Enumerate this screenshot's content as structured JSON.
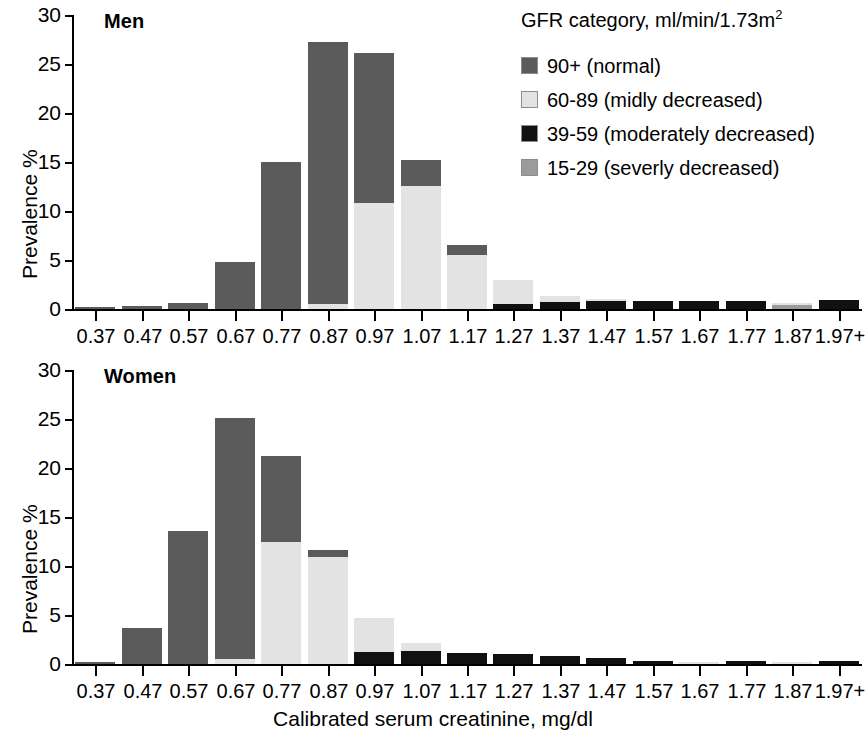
{
  "figure": {
    "xlabel": "Calibrated serum creatinine, mg/dl",
    "ylabel": "Prevalence %"
  },
  "legend": {
    "title_main": "GFR category, ml/min/1.73m",
    "title_sup": "2",
    "items": [
      {
        "label": "90+ (normal)",
        "color": "#5b5b5b"
      },
      {
        "label": "60-89 (midly decreased)",
        "color": "#e3e3e3"
      },
      {
        "label": "39-59 (moderately decreased)",
        "color": "#111111"
      },
      {
        "label": "15-29 (severly decreased)",
        "color": "#9b9b9b"
      }
    ]
  },
  "panels": [
    {
      "title": "Men"
    },
    {
      "title": "Women"
    }
  ],
  "chart_data": {
    "type": "bar",
    "subtype": "stacked histogram",
    "title": "",
    "xlabel": "Calibrated serum creatinine, mg/dl",
    "ylabel": "Prevalence %",
    "ylim": [
      0,
      30
    ],
    "yticks": [
      0,
      5,
      10,
      15,
      20,
      25,
      30
    ],
    "ytick_labels": [
      "0",
      "5",
      "10",
      "15",
      "20",
      "25",
      "30"
    ],
    "grid": false,
    "legend_position": "top-right",
    "legend_title": "GFR category, ml/min/1.73m2",
    "categories": [
      "0.37",
      "0.47",
      "0.57",
      "0.67",
      "0.77",
      "0.87",
      "0.97",
      "1.07",
      "1.17",
      "1.27",
      "1.37",
      "1.47",
      "1.57",
      "1.67",
      "1.77",
      "1.87",
      "1.97+"
    ],
    "panels": [
      {
        "name": "Men",
        "series": [
          {
            "name": "90+ (normal)",
            "color": "#5b5b5b",
            "values": [
              0.25,
              0.35,
              0.6,
              4.8,
              15.0,
              26.7,
              15.3,
              2.6,
              1.0,
              0.0,
              0.0,
              0.0,
              0.0,
              0.0,
              0.0,
              0.0,
              0.0
            ]
          },
          {
            "name": "60-89 (midly decreased)",
            "color": "#e3e3e3",
            "values": [
              0.0,
              0.0,
              0.0,
              0.0,
              0.0,
              0.55,
              10.8,
              12.6,
              5.5,
              2.4,
              0.6,
              0.15,
              0.0,
              0.0,
              0.0,
              0.25,
              0.0
            ]
          },
          {
            "name": "39-59 (moderately decreased)",
            "color": "#111111",
            "values": [
              0.0,
              0.0,
              0.0,
              0.0,
              0.0,
              0.0,
              0.0,
              0.0,
              0.0,
              0.55,
              0.75,
              0.8,
              0.85,
              0.85,
              0.8,
              0.0,
              0.9
            ]
          },
          {
            "name": "15-29 (severly decreased)",
            "color": "#9b9b9b",
            "values": [
              0.0,
              0.0,
              0.0,
              0.0,
              0.0,
              0.0,
              0.0,
              0.0,
              0.0,
              0.0,
              0.0,
              0.0,
              0.0,
              0.0,
              0.0,
              0.4,
              0.0
            ]
          }
        ],
        "totals": [
          0.25,
          0.35,
          0.6,
          4.8,
          15.0,
          27.25,
          26.1,
          15.2,
          6.5,
          2.95,
          1.35,
          0.95,
          0.85,
          0.85,
          0.8,
          0.65,
          0.9
        ]
      },
      {
        "name": "Women",
        "series": [
          {
            "name": "90+ (normal)",
            "color": "#5b5b5b",
            "values": [
              0.2,
              3.7,
              13.6,
              24.6,
              8.7,
              0.7,
              0.0,
              0.0,
              0.0,
              0.0,
              0.0,
              0.0,
              0.0,
              0.0,
              0.0,
              0.0,
              0.0
            ]
          },
          {
            "name": "60-89 (midly decreased)",
            "color": "#e3e3e3",
            "values": [
              0.0,
              0.0,
              0.0,
              0.55,
              12.5,
              10.9,
              3.5,
              0.8,
              0.0,
              0.0,
              0.0,
              0.0,
              0.0,
              0.25,
              0.0,
              0.2,
              0.0
            ]
          },
          {
            "name": "39-59 (moderately decreased)",
            "color": "#111111",
            "values": [
              0.0,
              0.0,
              0.0,
              0.0,
              0.0,
              0.0,
              1.2,
              1.35,
              1.15,
              1.0,
              0.8,
              0.6,
              0.3,
              0.0,
              0.3,
              0.0,
              0.3
            ]
          },
          {
            "name": "15-29 (severly decreased)",
            "color": "#9b9b9b",
            "values": [
              0.0,
              0.0,
              0.0,
              0.0,
              0.0,
              0.0,
              0.0,
              0.0,
              0.0,
              0.0,
              0.0,
              0.0,
              0.0,
              0.0,
              0.0,
              0.0,
              0.0
            ]
          }
        ],
        "totals": [
          0.2,
          3.7,
          13.6,
          25.15,
          21.2,
          11.6,
          4.7,
          2.15,
          1.15,
          1.0,
          0.8,
          0.6,
          0.3,
          0.25,
          0.3,
          0.2,
          0.3
        ]
      }
    ]
  }
}
